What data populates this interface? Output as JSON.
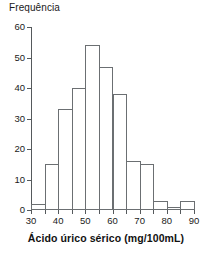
{
  "chart_data": {
    "type": "bar",
    "title": "",
    "xlabel": "Ácido úrico sérico (mg/100mL)",
    "ylabel": "Frequência",
    "categories": [
      "30-35",
      "35-40",
      "40-45",
      "45-50",
      "50-55",
      "55-60",
      "60-65",
      "65-70",
      "70-75",
      "75-80",
      "80-85",
      "85-90"
    ],
    "bin_edges": [
      30,
      35,
      40,
      45,
      50,
      55,
      60,
      65,
      70,
      75,
      80,
      85,
      90
    ],
    "values": [
      2,
      15,
      33,
      40,
      54,
      47,
      38,
      16,
      15,
      3,
      1,
      3
    ],
    "xlim": [
      30,
      90
    ],
    "ylim": [
      0,
      60
    ],
    "xticks": [
      30,
      35,
      40,
      45,
      50,
      55,
      60,
      65,
      70,
      75,
      80,
      85,
      90
    ],
    "xtick_labels": [
      "30",
      "",
      "40",
      "",
      "50",
      "",
      "60",
      "",
      "70",
      "",
      "80",
      "",
      "90"
    ],
    "yticks": [
      0,
      10,
      20,
      30,
      40,
      50,
      60
    ],
    "ytick_labels": [
      "0",
      "10",
      "20",
      "30",
      "40",
      "50",
      "60"
    ],
    "grid": false,
    "legend": null,
    "bar_fill_color": "#ffffff",
    "bar_edge_color": "#6b6f72",
    "axis_color": "#55595c",
    "background_color": "#ffffff"
  }
}
